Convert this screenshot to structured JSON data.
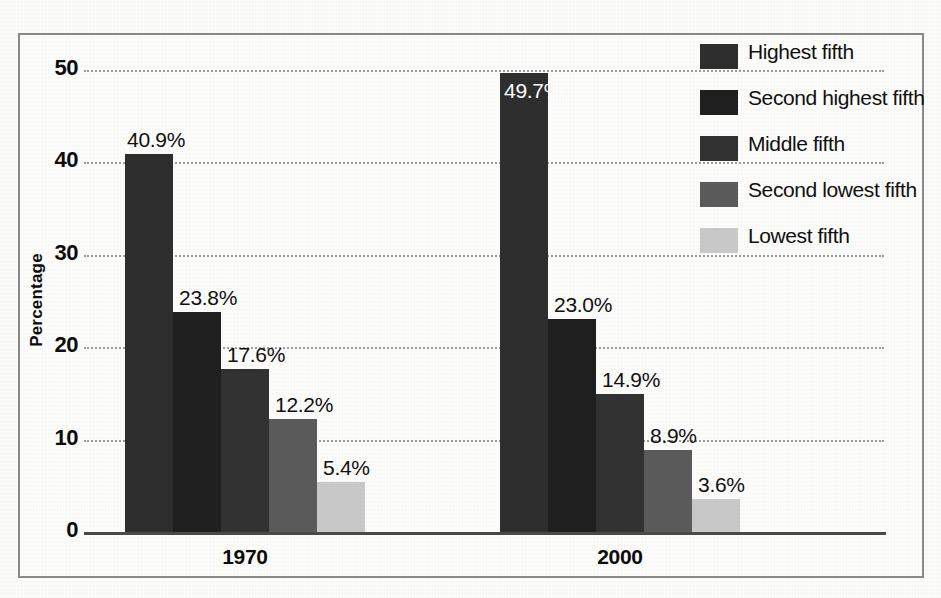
{
  "chart_data": {
    "type": "bar",
    "title": "",
    "xlabel": "",
    "ylabel": "Percentage",
    "ylim": [
      0,
      50
    ],
    "yticks": [
      "0",
      "10",
      "20",
      "30",
      "40",
      "50"
    ],
    "grid": true,
    "legend_position": "top-right",
    "categories": [
      "1970",
      "2000"
    ],
    "series": [
      {
        "name": "Highest fifth",
        "color": "#2e2e2e",
        "values": [
          40.9,
          49.7
        ],
        "labels": [
          "40.9%",
          "49.7%"
        ]
      },
      {
        "name": "Second highest fifth",
        "color": "#1f1f1f",
        "values": [
          23.8,
          23.0
        ],
        "labels": [
          "23.8%",
          "23.0%"
        ]
      },
      {
        "name": "Middle fifth",
        "color": "#323232",
        "values": [
          17.6,
          14.9
        ],
        "labels": [
          "17.6%",
          "14.9%"
        ]
      },
      {
        "name": "Second lowest fifth",
        "color": "#5b5b5b",
        "values": [
          12.2,
          8.9
        ],
        "labels": [
          "12.2%",
          "8.9%"
        ]
      },
      {
        "name": "Lowest fifth",
        "color": "#c9c9c9",
        "values": [
          5.4,
          3.6
        ],
        "labels": [
          "5.4%",
          "3.6%"
        ]
      }
    ]
  },
  "legend": {
    "items": [
      {
        "label": "Highest fifth",
        "color": "#2e2e2e"
      },
      {
        "label": "Second highest fifth",
        "color": "#1f1f1f"
      },
      {
        "label": "Middle fifth",
        "color": "#323232"
      },
      {
        "label": "Second lowest fifth",
        "color": "#5b5b5b"
      },
      {
        "label": "Lowest fifth",
        "color": "#c9c9c9"
      }
    ]
  },
  "axis": {
    "y_title": "Percentage",
    "y_ticks": [
      "50",
      "40",
      "30",
      "20",
      "10",
      "0"
    ],
    "x_groups": [
      "1970",
      "2000"
    ]
  },
  "style": {
    "frame_color": "#8a8a8a",
    "gridline_color": "#9b9b9b",
    "axis_color": "#4a4a4a",
    "text_color": "#101010",
    "background": "#fbfbfa"
  }
}
